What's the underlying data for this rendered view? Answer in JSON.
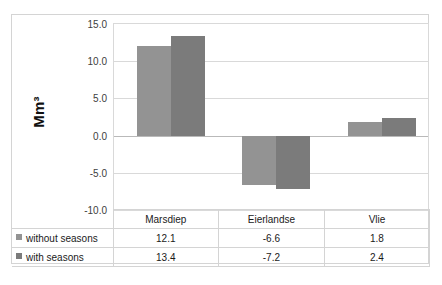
{
  "chart_data": {
    "type": "bar",
    "title": "",
    "xlabel": "",
    "ylabel": "Mm³",
    "ylim": [
      -10.0,
      15.0
    ],
    "grid": true,
    "legend_position": "table-left",
    "categories": [
      "Marsdiep",
      "Eierlandse",
      "Vlie"
    ],
    "yticks": [
      "15.0",
      "10.0",
      "5.0",
      "0.0",
      "-5.0",
      "-10.0"
    ],
    "ytick_values": [
      15.0,
      10.0,
      5.0,
      0.0,
      -5.0,
      -10.0
    ],
    "series": [
      {
        "name": "without seasons",
        "color": "#939393",
        "values": [
          12.1,
          -6.6,
          1.8
        ],
        "labels": [
          "12.1",
          "-6.6",
          "1.8"
        ]
      },
      {
        "name": "with seasons",
        "color": "#7b7b7b",
        "values": [
          13.4,
          -7.2,
          2.4
        ],
        "labels": [
          "13.4",
          "-7.2",
          "2.4"
        ]
      }
    ]
  },
  "table": {
    "corner": "",
    "header": [
      "Marsdiep",
      "Eierlandse",
      "Vlie"
    ],
    "rows": [
      {
        "label": "without seasons",
        "values": [
          "12.1",
          "-6.6",
          "1.8"
        ]
      },
      {
        "label": "with seasons",
        "values": [
          "13.4",
          "-7.2",
          "2.4"
        ]
      }
    ]
  },
  "colors": {
    "series_light": "#939393",
    "series_dark": "#7b7b7b",
    "gridline": "#d9d9d9",
    "border": "#d4d4d4",
    "zero_axis": "#b9b9b9"
  }
}
